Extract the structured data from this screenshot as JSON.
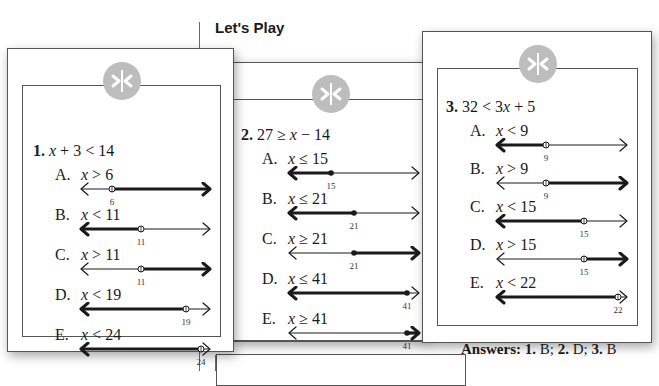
{
  "header": {
    "title": "Let's Play"
  },
  "icon": "greater-less-divider-icon",
  "colors": {
    "badge": "#bdbdbd",
    "frame": "#555555",
    "ink": "#1a1a1a"
  },
  "cards": [
    {
      "number": "1.",
      "problem": "x + 3 < 14",
      "options": [
        {
          "letter": "A.",
          "inequality": "x > 6",
          "point": "6",
          "point_type": "open",
          "direction": "right",
          "tick_fraction": 0.25
        },
        {
          "letter": "B.",
          "inequality": "x < 11",
          "point": "11",
          "point_type": "open",
          "direction": "left",
          "tick_fraction": 0.47
        },
        {
          "letter": "C.",
          "inequality": "x > 11",
          "point": "11",
          "point_type": "open",
          "direction": "right",
          "tick_fraction": 0.47
        },
        {
          "letter": "D.",
          "inequality": "x < 19",
          "point": "19",
          "point_type": "open",
          "direction": "left",
          "tick_fraction": 0.8
        },
        {
          "letter": "E.",
          "inequality": "x < 24",
          "point": "24",
          "point_type": "open",
          "direction": "left",
          "tick_fraction": 0.91
        }
      ]
    },
    {
      "number": "2.",
      "problem": "27 ≥ x − 14",
      "options": [
        {
          "letter": "A.",
          "inequality": "x ≤ 15",
          "point": "15",
          "point_type": "closed",
          "direction": "left",
          "tick_fraction": 0.33
        },
        {
          "letter": "B.",
          "inequality": "x ≤ 21",
          "point": "21",
          "point_type": "closed",
          "direction": "left",
          "tick_fraction": 0.5
        },
        {
          "letter": "C.",
          "inequality": "x ≥ 21",
          "point": "21",
          "point_type": "closed",
          "direction": "right",
          "tick_fraction": 0.5
        },
        {
          "letter": "D.",
          "inequality": "x ≤ 41",
          "point": "41",
          "point_type": "closed",
          "direction": "left",
          "tick_fraction": 0.89
        },
        {
          "letter": "E.",
          "inequality": "x ≥ 41",
          "point": "41",
          "point_type": "closed",
          "direction": "right",
          "tick_fraction": 0.89
        }
      ]
    },
    {
      "number": "3.",
      "problem": "32 < 3x + 5",
      "options": [
        {
          "letter": "A.",
          "inequality": "x < 9",
          "point": "9",
          "point_type": "open",
          "direction": "left",
          "tick_fraction": 0.38
        },
        {
          "letter": "B.",
          "inequality": "x > 9",
          "point": "9",
          "point_type": "open",
          "direction": "right",
          "tick_fraction": 0.38
        },
        {
          "letter": "C.",
          "inequality": "x < 15",
          "point": "15",
          "point_type": "open",
          "direction": "left",
          "tick_fraction": 0.66
        },
        {
          "letter": "D.",
          "inequality": "x > 15",
          "point": "15",
          "point_type": "open",
          "direction": "right",
          "tick_fraction": 0.66
        },
        {
          "letter": "E.",
          "inequality": "x < 22",
          "point": "22",
          "point_type": "open",
          "direction": "left",
          "tick_fraction": 0.91
        }
      ]
    }
  ],
  "answers": {
    "label": "Answers:",
    "items": [
      {
        "num": "1.",
        "ans": "B;"
      },
      {
        "num": "2.",
        "ans": "D;"
      },
      {
        "num": "3.",
        "ans": "B"
      }
    ]
  }
}
